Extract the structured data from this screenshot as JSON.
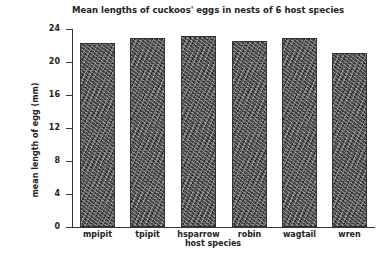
{
  "chart_data": {
    "type": "bar",
    "title": "Mean lengths of cuckoos' eggs in nests of 6 host species",
    "xlabel": "host species",
    "ylabel": "mean length of egg (mm)",
    "categories": [
      "mpipit",
      "tpipit",
      "hsparrow",
      "robin",
      "wagtail",
      "wren"
    ],
    "values": [
      22.3,
      22.9,
      23.1,
      22.6,
      22.9,
      21.1
    ],
    "ylim": [
      0,
      24
    ],
    "yticks": [
      0,
      4,
      8,
      12,
      16,
      20,
      24
    ],
    "grid": false,
    "legend": "none",
    "bar_fill": "stippled dark gray texture"
  }
}
